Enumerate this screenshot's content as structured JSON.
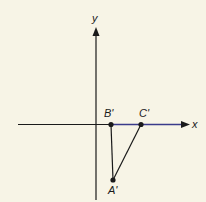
{
  "diagram": {
    "axes": {
      "x_label": "x",
      "y_label": "y",
      "x_axis_color": "#3a3a8a",
      "y_axis_color": "#1a1a1a"
    },
    "points": [
      {
        "name": "A'",
        "x": 113,
        "y": 180
      },
      {
        "name": "B'",
        "x": 111,
        "y": 124
      },
      {
        "name": "C'",
        "x": 141,
        "y": 124
      }
    ],
    "segments": [
      [
        "B'",
        "A'"
      ],
      [
        "C'",
        "A'"
      ],
      [
        "B'",
        "C'"
      ]
    ],
    "labels": {
      "a": "A'",
      "b": "B'",
      "c": "C'"
    }
  }
}
